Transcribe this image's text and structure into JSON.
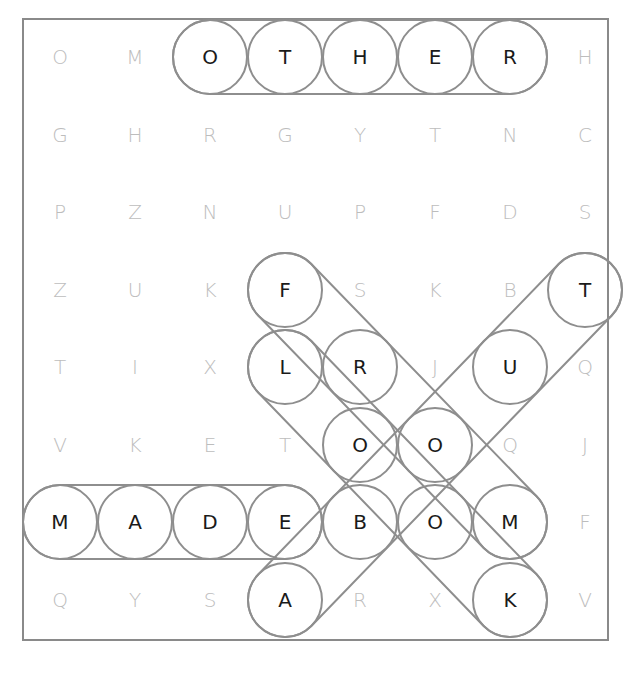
{
  "puzzle": {
    "rows": 8,
    "cols": 8,
    "grid": [
      [
        "O",
        "M",
        "O",
        "T",
        "H",
        "E",
        "R",
        "H"
      ],
      [
        "G",
        "H",
        "R",
        "G",
        "Y",
        "T",
        "N",
        "C"
      ],
      [
        "P",
        "Z",
        "N",
        "U",
        "P",
        "F",
        "D",
        "S"
      ],
      [
        "Z",
        "U",
        "K",
        "F",
        "S",
        "K",
        "B",
        "T"
      ],
      [
        "T",
        "I",
        "X",
        "L",
        "R",
        "J",
        "U",
        "Q"
      ],
      [
        "V",
        "K",
        "E",
        "T",
        "O",
        "O",
        "Q",
        "J"
      ],
      [
        "M",
        "A",
        "D",
        "E",
        "B",
        "O",
        "M",
        "F"
      ],
      [
        "Q",
        "Y",
        "S",
        "A",
        "R",
        "X",
        "K",
        "V"
      ]
    ],
    "found_words": [
      {
        "word": "OTHER",
        "cells": [
          [
            0,
            2
          ],
          [
            0,
            3
          ],
          [
            0,
            4
          ],
          [
            0,
            5
          ],
          [
            0,
            6
          ]
        ],
        "direction": "horizontal"
      },
      {
        "word": "MADE",
        "cells": [
          [
            6,
            0
          ],
          [
            6,
            1
          ],
          [
            6,
            2
          ],
          [
            6,
            3
          ]
        ],
        "direction": "horizontal"
      },
      {
        "word": "FROM",
        "cells": [
          [
            3,
            3
          ],
          [
            4,
            4
          ],
          [
            5,
            5
          ],
          [
            6,
            6
          ]
        ],
        "direction": "diagonal-down-right"
      },
      {
        "word": "LOOK",
        "cells": [
          [
            4,
            3
          ],
          [
            5,
            4
          ],
          [
            6,
            5
          ],
          [
            7,
            6
          ]
        ],
        "direction": "diagonal-down-right"
      },
      {
        "word": "ABOUT",
        "cells": [
          [
            7,
            3
          ],
          [
            6,
            4
          ],
          [
            5,
            5
          ],
          [
            4,
            6
          ],
          [
            3,
            7
          ]
        ],
        "direction": "diagonal-up-right"
      }
    ]
  },
  "colors": {
    "frame": "#8a8a8a",
    "highlight_stroke": "#8e8e8e",
    "found_letter": "#1a1a1a",
    "unused_letter": "#bdbdbd",
    "background": "#ffffff"
  },
  "layout": {
    "frame": {
      "x": 23,
      "y": 19,
      "w": 585,
      "h": 621
    },
    "col_x": [
      60,
      135,
      210,
      285,
      360,
      435,
      510,
      585
    ],
    "row_y": [
      57,
      135,
      212,
      290,
      367,
      445,
      522,
      600
    ],
    "ring_radius": 37
  }
}
